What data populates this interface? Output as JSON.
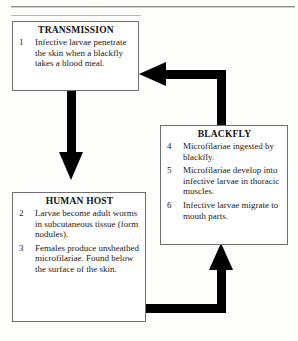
{
  "page": {
    "background_color": "#fdfdfc",
    "ink_color": "#000000",
    "rule_color": "#8e8e8e",
    "scan_artifact_text": "' . . ."
  },
  "diagram": {
    "type": "cycle-flow-diagram",
    "boxes": [
      {
        "id": "transmission",
        "title": "TRANSMISSION",
        "items": [
          {
            "number": "1",
            "text": "Infective larvae penetrate the skin when a blackfly takes a blood meal."
          }
        ]
      },
      {
        "id": "human-host",
        "title": "HUMAN HOST",
        "items": [
          {
            "number": "2",
            "text": "Larvae become adult worms in subcutaneous tissue (form nodules)."
          },
          {
            "number": "3",
            "text": "Females produce unsheathed microfilariae. Found below the surface of the skin."
          }
        ]
      },
      {
        "id": "blackfly",
        "title": "BLACKFLY",
        "items": [
          {
            "number": "4",
            "text": "Microfilariae ingested by blackfly."
          },
          {
            "number": "5",
            "text": "Microfilariae develop into infective larvae in thoracic muscles."
          },
          {
            "number": "6",
            "text": "Infective larvae migrate to mouth parts."
          }
        ]
      }
    ],
    "arrows": [
      {
        "id": "transmission-to-human-host",
        "from": "transmission",
        "to": "human-host",
        "direction": "down"
      },
      {
        "id": "human-host-to-blackfly",
        "from": "human-host",
        "to": "blackfly",
        "direction": "right-then-up"
      },
      {
        "id": "blackfly-to-transmission",
        "from": "blackfly",
        "to": "transmission",
        "direction": "up-then-left"
      }
    ]
  }
}
